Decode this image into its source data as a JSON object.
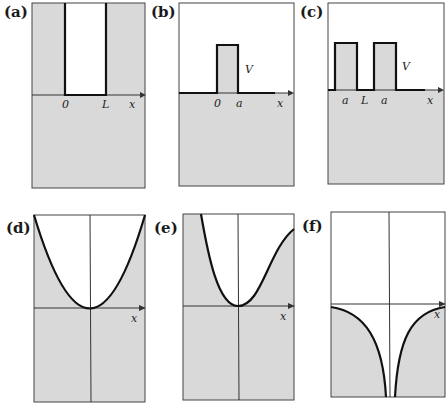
{
  "figure": {
    "shade_color": "#d9d9d9",
    "line_color": "#111111",
    "panels": [
      {
        "id": "a",
        "label": "(a)",
        "kind": "infinite square well",
        "ticks": [
          "0",
          "L"
        ],
        "axis_label": "x"
      },
      {
        "id": "b",
        "label": "(b)",
        "kind": "single rectangular barrier",
        "ticks": [
          "0",
          "a"
        ],
        "height_label": "V",
        "axis_label": "x"
      },
      {
        "id": "c",
        "label": "(c)",
        "kind": "double rectangular barrier",
        "ticks": [
          "a",
          "L",
          "a"
        ],
        "height_label": "V",
        "axis_label": "x"
      },
      {
        "id": "d",
        "label": "(d)",
        "kind": "harmonic (parabolic) potential",
        "axis_label": "x"
      },
      {
        "id": "e",
        "label": "(e)",
        "kind": "anharmonic potential, saturating at large x",
        "axis_label": "x"
      },
      {
        "id": "f",
        "label": "(f)",
        "kind": "Coulomb-like potential diverging to -infinity at origin",
        "axis_label": "x"
      }
    ]
  }
}
